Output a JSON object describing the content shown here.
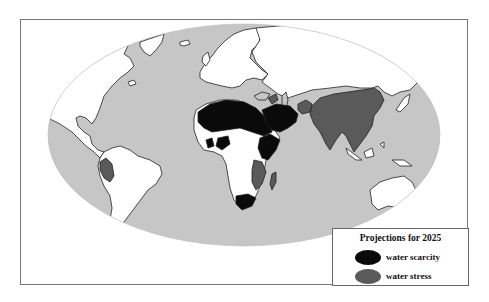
{
  "map": {
    "title": "World map of projected water scarcity and stress",
    "colors": {
      "ocean": "#c6c6c6",
      "land": "#ffffff",
      "coastline": "#222222",
      "water_scarcity": "#0a0a0a",
      "water_stress": "#5a5a5a"
    },
    "regions_water_scarcity": [
      "North Africa",
      "Middle East",
      "Arabian Peninsula",
      "Horn of Africa",
      "Southern Africa",
      "West Africa (partial)"
    ],
    "regions_water_stress": [
      "Peru",
      "India",
      "China",
      "Southeast Asia",
      "Afghanistan",
      "East Africa",
      "Madagascar",
      "Caucasus"
    ]
  },
  "legend": {
    "title": "Projections for 2025",
    "items": [
      {
        "label": "water scarcity",
        "color": "#0a0a0a"
      },
      {
        "label": "water stress",
        "color": "#5a5a5a"
      }
    ]
  }
}
